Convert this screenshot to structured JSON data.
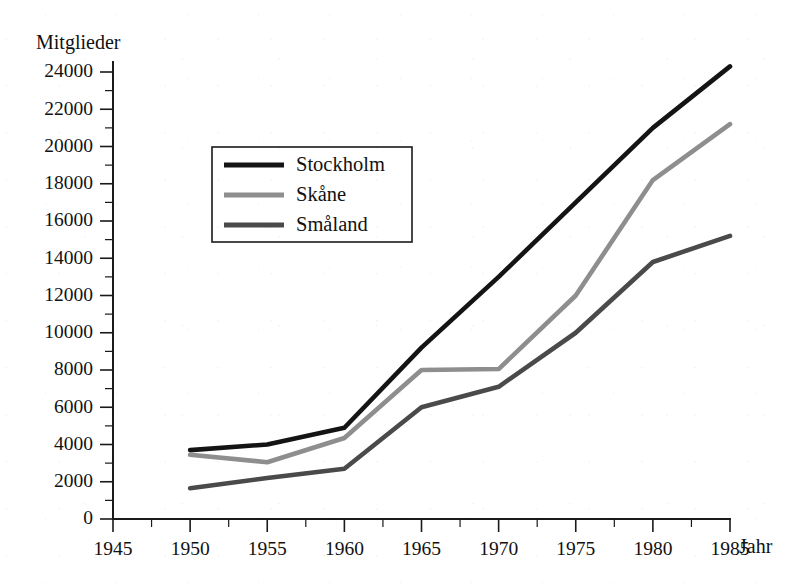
{
  "chart_data": {
    "type": "line",
    "title": "",
    "ylabel": "Mitglieder",
    "xlabel": "Jahr",
    "xlim": [
      1945,
      1985
    ],
    "ylim": [
      0,
      24000
    ],
    "grid": false,
    "legend_position": "upper-left-inside",
    "x_ticks": [
      1945,
      1950,
      1955,
      1960,
      1965,
      1970,
      1975,
      1980,
      1985
    ],
    "x_tick_labels": [
      "1945",
      "1950",
      "1955",
      "1960",
      "1965",
      "1970",
      "1975",
      "1980",
      "1985"
    ],
    "x_minor_step": 2.5,
    "y_ticks": [
      0,
      2000,
      4000,
      6000,
      8000,
      10000,
      12000,
      14000,
      16000,
      18000,
      20000,
      22000,
      24000
    ],
    "y_tick_labels": [
      "0",
      "2000",
      "4000",
      "6000",
      "8000",
      "10000",
      "12000",
      "14000",
      "16000",
      "18000",
      "20000",
      "22000",
      "24000"
    ],
    "y_minor_step": 1000,
    "x": [
      1950,
      1955,
      1960,
      1965,
      1970,
      1975,
      1980,
      1985
    ],
    "series": [
      {
        "name": "Stockholm",
        "color": "#141414",
        "values": [
          3700,
          4000,
          4900,
          9200,
          13000,
          17000,
          21000,
          24300
        ]
      },
      {
        "name": "Skåne",
        "color": "#8e8e8e",
        "values": [
          3450,
          3050,
          4350,
          8000,
          8050,
          12000,
          18200,
          21200
        ]
      },
      {
        "name": "Småland",
        "color": "#4a4a4a",
        "values": [
          1650,
          2200,
          2700,
          6000,
          7100,
          10000,
          13800,
          15200
        ]
      }
    ]
  },
  "legend": {
    "entries": [
      {
        "label": "Stockholm",
        "color": "#141414"
      },
      {
        "label": "Skåne",
        "color": "#8e8e8e"
      },
      {
        "label": "Småland",
        "color": "#4a4a4a"
      }
    ]
  }
}
